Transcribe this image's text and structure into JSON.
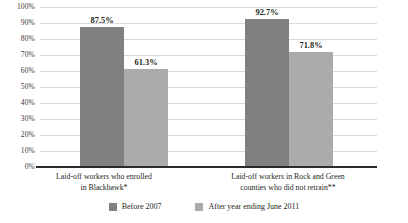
{
  "chart_data": {
    "type": "bar",
    "title": "",
    "subtitle": "",
    "xlabel": "",
    "ylabel": "",
    "ylim": [
      0,
      100
    ],
    "grid": true,
    "legend_position": "bottom-center",
    "value_suffix": "%",
    "y_ticks": [
      "100%",
      "90%",
      "80%",
      "70%",
      "60%",
      "50%",
      "40%",
      "30%",
      "20%",
      "10%",
      "0%"
    ],
    "y_tick_values": [
      100,
      90,
      80,
      70,
      60,
      50,
      40,
      30,
      20,
      10,
      0
    ],
    "categories": [
      "Laid-off workers who enrolled in Blackhawk*",
      "Laid-off workers in Rock and Green counties who did not retrain**"
    ],
    "category_lines": [
      [
        "Laid-off workers who enrolled",
        "in Blackhawk*"
      ],
      [
        "Laid-off workers in Rock and Green",
        "counties who did not retrain**"
      ]
    ],
    "series": [
      {
        "name": "Before 2007",
        "color": "#808080",
        "values": [
          87.5,
          92.7
        ],
        "labels": [
          "87.5%",
          "92.7%"
        ]
      },
      {
        "name": "After year ending June 2011",
        "color": "#ababab",
        "values": [
          61.3,
          71.8
        ],
        "labels": [
          "61.3%",
          "71.8%"
        ]
      }
    ]
  },
  "colors": {
    "series_dark": "#808080",
    "series_light": "#ababab",
    "gridline": "#d9d9d9",
    "axis": "#2b2b2b",
    "text": "#231f20",
    "background": "#ffffff"
  }
}
